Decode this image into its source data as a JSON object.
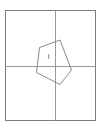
{
  "figure": {
    "label": "I",
    "polygon_points": "60,40 71.5,70 60,84.5 36.5,72.5 39.5,47.5",
    "label_x": "48.5",
    "label_y": "58.5"
  },
  "colors": {
    "background": "#ffffff",
    "frame": "#7d7d7d",
    "grid": "#999999",
    "polygon": "#8a8a8a",
    "label": "#6e6e6e"
  }
}
